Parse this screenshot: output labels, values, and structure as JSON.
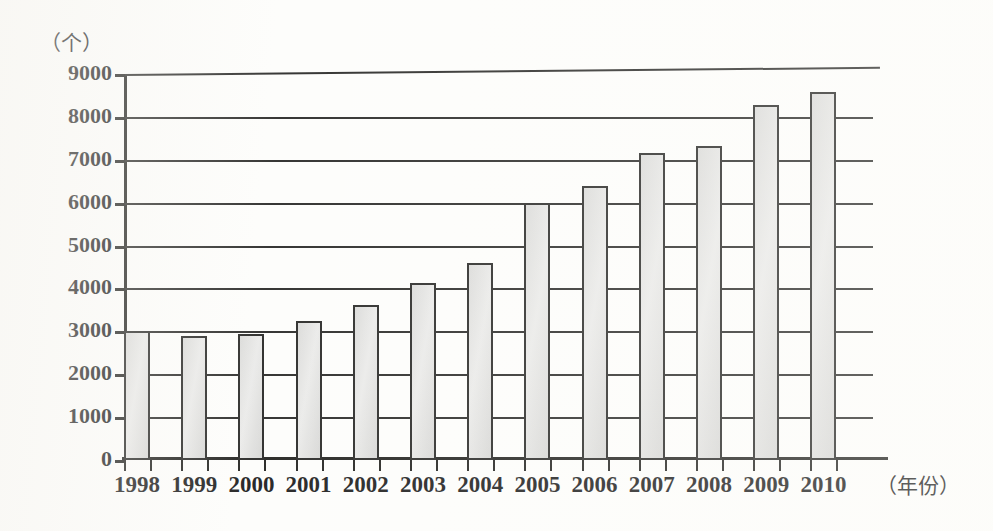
{
  "chart_data": {
    "type": "bar",
    "title": "",
    "subtitle": "",
    "xlabel": "（年份）",
    "ylabel": "（个）",
    "categories": [
      "1998",
      "1999",
      "2000",
      "2001",
      "2002",
      "2003",
      "2004",
      "2005",
      "2006",
      "2007",
      "2008",
      "2009",
      "2010"
    ],
    "values": [
      3000,
      2900,
      2930,
      3250,
      3620,
      4120,
      4600,
      6000,
      6380,
      7150,
      7330,
      8280,
      8580
    ],
    "ylim": [
      0,
      9000
    ],
    "ytick_labels": [
      "0",
      "1000",
      "2000",
      "3000",
      "4000",
      "5000",
      "6000",
      "7000",
      "8000",
      "9000"
    ],
    "ytick_values": [
      0,
      1000,
      2000,
      3000,
      4000,
      5000,
      6000,
      7000,
      8000,
      9000
    ],
    "grid": true,
    "grid_axis": "y",
    "legend": false,
    "legend_position": "none",
    "bar_fill_color": "#e2e2e0",
    "bar_edge_color": "#1d1d1b",
    "axis_color": "#171714",
    "background_color": "#fdfdfb"
  }
}
